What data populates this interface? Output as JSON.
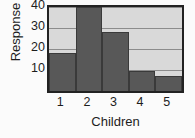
{
  "chart_data": {
    "type": "bar",
    "title": "",
    "subtitle": "",
    "xlabel": "Children",
    "ylabel": "Response",
    "categories": [
      "1",
      "2",
      "3",
      "4",
      "5"
    ],
    "values": [
      18,
      40,
      28,
      9.5,
      7
    ],
    "series": [
      {
        "name": "Response",
        "values": [
          18,
          40,
          28,
          9.5,
          7
        ]
      }
    ],
    "ylim": [
      0,
      40
    ],
    "yticks": [
      10,
      20,
      30,
      40
    ],
    "ytick_labels": [
      "10",
      "20",
      "30",
      "40"
    ],
    "xtick_labels": [
      "1",
      "2",
      "3",
      "4",
      "5"
    ],
    "grid": true,
    "gridlines_at": [
      10,
      20,
      30,
      40
    ],
    "legend": null,
    "legend_position": "none",
    "annotations": [],
    "colors": {
      "bar_fill": "#585858",
      "bar_edge": "#3a3a3a",
      "panel_background": "#d9d9d9",
      "gridline": "#8c8c8c",
      "frame": "#222222",
      "text": "#1d1d1d",
      "figure_background": "#fbfbfb"
    }
  }
}
